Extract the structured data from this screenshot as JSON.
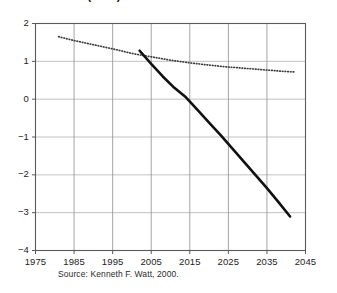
{
  "figure": {
    "clipped_title": "Oil & Gas (1000)",
    "source_note": "Source: Kenneth F. Watt, 2000."
  },
  "chart_data": {
    "type": "line",
    "title": "",
    "xlabel": "",
    "ylabel": "",
    "xlim": [
      1975,
      2045
    ],
    "ylim": [
      -4,
      2
    ],
    "xticks": [
      1975,
      1985,
      1995,
      2005,
      2015,
      2025,
      2035,
      2045
    ],
    "yticks": [
      2,
      1,
      0,
      -1,
      -2,
      -3,
      -4
    ],
    "xtick_labels": [
      "1975",
      "1985",
      "1995",
      "2005",
      "2015",
      "2025",
      "2035",
      "2045"
    ],
    "ytick_labels": [
      "2",
      "1",
      "0",
      "-1",
      "-2",
      "-3",
      "-4"
    ],
    "grid": true,
    "legend": "none",
    "series": [
      {
        "name": "historical-trend-dotted",
        "style": "dotted",
        "color": "#3a3a3a",
        "x": [
          1981,
          1985,
          1990,
          1995,
          2000,
          2002,
          2005,
          2010,
          2015,
          2020,
          2025,
          2030,
          2035,
          2040,
          2042
        ],
        "values": [
          1.65,
          1.55,
          1.44,
          1.33,
          1.21,
          1.17,
          1.12,
          1.03,
          0.96,
          0.9,
          0.85,
          0.81,
          0.77,
          0.73,
          0.72
        ]
      },
      {
        "name": "projection-solid",
        "style": "solid",
        "color": "#111111",
        "x": [
          2002,
          2005,
          2008,
          2011,
          2014,
          2017,
          2020,
          2023,
          2026,
          2029,
          2032,
          2035,
          2038,
          2041
        ],
        "values": [
          1.28,
          0.93,
          0.6,
          0.3,
          0.05,
          -0.28,
          -0.62,
          -0.95,
          -1.3,
          -1.65,
          -2.0,
          -2.35,
          -2.72,
          -3.1
        ]
      }
    ]
  }
}
